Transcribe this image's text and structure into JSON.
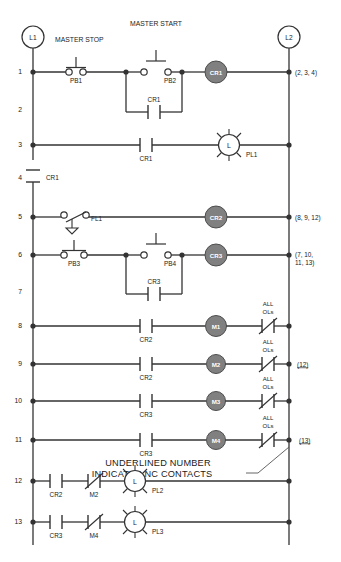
{
  "diagram": {
    "type": "ladder-logic",
    "rails": {
      "left": "L1",
      "right": "L2"
    },
    "headers": [
      {
        "text": "MASTER STOP",
        "x": 55,
        "y": 42
      },
      {
        "text": "MASTER START",
        "x": 130,
        "y": 26
      }
    ],
    "note": {
      "line1": "UNDERLINED NUMBER",
      "line2": "INDICATES NC CONTACTS"
    },
    "rung_numbers": [
      "1",
      "2",
      "3",
      "4",
      "5",
      "6",
      "7",
      "8",
      "9",
      "10",
      "11",
      "12",
      "13"
    ],
    "rungs": [
      {
        "number": "1",
        "y": 72,
        "xref": "(2, 3, 4)",
        "xref_underlined": false,
        "contacts": [
          {
            "label": "PB1",
            "type": "nc-pushbutton"
          },
          {
            "label": "PB2",
            "type": "no-pushbutton"
          },
          {
            "label": "CR1",
            "type": "no-branch"
          }
        ],
        "output": {
          "label": "CR1",
          "type": "coil"
        }
      },
      {
        "number": "2",
        "y": 110,
        "xref": "",
        "contacts": [],
        "output": null
      },
      {
        "number": "3",
        "y": 145,
        "xref": "",
        "contacts": [
          {
            "label": "CR1",
            "type": "no"
          }
        ],
        "output": {
          "label": "PL1",
          "type": "lamp",
          "inner": "L"
        }
      },
      {
        "number": "4",
        "y": 180,
        "xref": "",
        "contacts": [
          {
            "label": "CR1",
            "type": "no-vertical"
          }
        ],
        "output": null
      },
      {
        "number": "5",
        "y": 217,
        "xref": "(8, 9, 12)",
        "xref_underlined": false,
        "contacts": [
          {
            "label": "FL1",
            "type": "float-switch"
          }
        ],
        "output": {
          "label": "CR2",
          "type": "coil"
        }
      },
      {
        "number": "6",
        "y": 255,
        "xref": "(7, 10,",
        "xref_line2": "11, 13)",
        "xref_underlined": false,
        "contacts": [
          {
            "label": "PB3",
            "type": "nc-pushbutton"
          },
          {
            "label": "PB4",
            "type": "no-pushbutton"
          },
          {
            "label": "CR3",
            "type": "no-branch"
          }
        ],
        "output": {
          "label": "CR3",
          "type": "coil"
        }
      },
      {
        "number": "7",
        "y": 292,
        "xref": "",
        "contacts": [],
        "output": null
      },
      {
        "number": "8",
        "y": 326,
        "xref": "",
        "contacts": [
          {
            "label": "CR2",
            "type": "no"
          }
        ],
        "output": {
          "label": "M1",
          "type": "coil"
        },
        "overload": {
          "line1": "ALL",
          "line2": "OLs",
          "type": "nc"
        }
      },
      {
        "number": "9",
        "y": 364,
        "xref": "(12)",
        "xref_underlined": true,
        "contacts": [
          {
            "label": "CR2",
            "type": "no"
          }
        ],
        "output": {
          "label": "M2",
          "type": "coil"
        },
        "overload": {
          "line1": "ALL",
          "line2": "OLs",
          "type": "nc"
        }
      },
      {
        "number": "10",
        "y": 401,
        "xref": "",
        "contacts": [
          {
            "label": "CR3",
            "type": "no"
          }
        ],
        "output": {
          "label": "M3",
          "type": "coil"
        },
        "overload": {
          "line1": "ALL",
          "line2": "OLs",
          "type": "nc"
        }
      },
      {
        "number": "11",
        "y": 440,
        "xref": "(13)",
        "xref_underlined": true,
        "contacts": [
          {
            "label": "CR3",
            "type": "no"
          }
        ],
        "output": {
          "label": "M4",
          "type": "coil"
        },
        "overload": {
          "line1": "ALL",
          "line2": "OLs",
          "type": "nc"
        }
      },
      {
        "number": "12",
        "y": 481,
        "xref": "",
        "contacts": [
          {
            "label": "CR2",
            "type": "no"
          },
          {
            "label": "M2",
            "type": "nc"
          }
        ],
        "output": {
          "label": "PL2",
          "type": "lamp",
          "inner": "L"
        }
      },
      {
        "number": "13",
        "y": 522,
        "xref": "",
        "contacts": [
          {
            "label": "CR3",
            "type": "no"
          },
          {
            "label": "M4",
            "type": "nc"
          }
        ],
        "output": {
          "label": "PL3",
          "type": "lamp",
          "inner": "L"
        }
      }
    ],
    "colors": {
      "line": "#333333",
      "coil_fill": "#808080",
      "coil_text": "#ffffff",
      "background": "#ffffff",
      "text": "#1a1a1a"
    }
  }
}
